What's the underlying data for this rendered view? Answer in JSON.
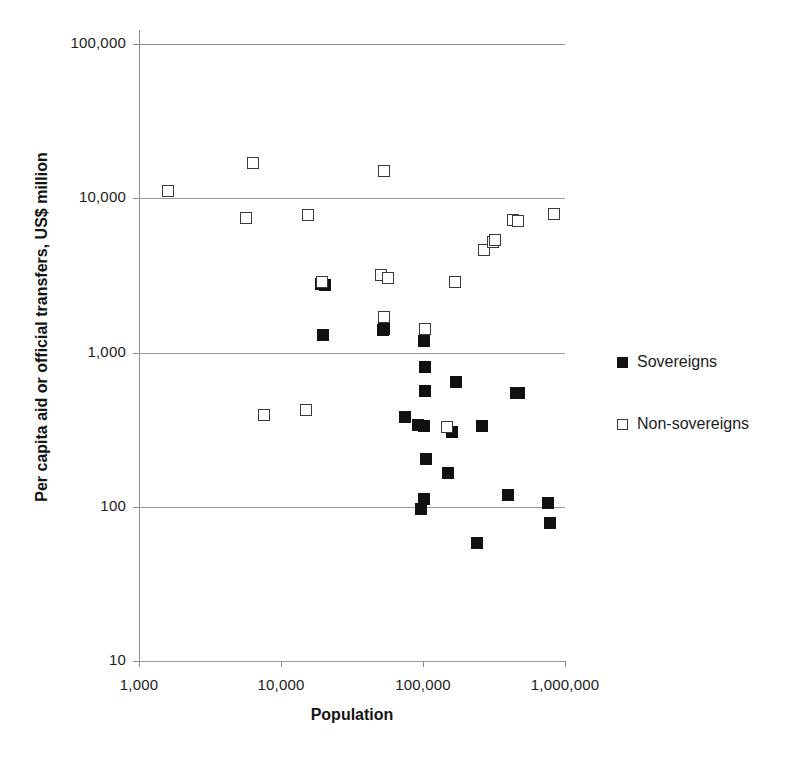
{
  "chart_data": {
    "type": "scatter",
    "title": "",
    "xlabel": "Population",
    "ylabel": "Per capita aid or official transfers, US$ million",
    "xscale": "log",
    "yscale": "log",
    "xlim": [
      1000,
      1000000
    ],
    "ylim": [
      10,
      100000
    ],
    "xticks": [
      1000,
      10000,
      100000,
      1000000
    ],
    "xtick_labels": [
      "1,000",
      "10,000",
      "100,000",
      "1,000,000"
    ],
    "yticks": [
      10,
      100,
      1000,
      10000,
      100000
    ],
    "ytick_labels": [
      "10",
      "100",
      "1,000",
      "10,000",
      "100,000"
    ],
    "grid": true,
    "grid_axis": "y",
    "legend_position": "right",
    "series": [
      {
        "name": "Sovereigns",
        "marker": "filled-square",
        "color": "#111111",
        "points": [
          {
            "x": 19200,
            "y": 2800
          },
          {
            "x": 20500,
            "y": 2750
          },
          {
            "x": 19800,
            "y": 1300
          },
          {
            "x": 52000,
            "y": 1400
          },
          {
            "x": 53000,
            "y": 1420
          },
          {
            "x": 101000,
            "y": 1180
          },
          {
            "x": 103000,
            "y": 800
          },
          {
            "x": 104000,
            "y": 560
          },
          {
            "x": 171000,
            "y": 640
          },
          {
            "x": 449000,
            "y": 545
          },
          {
            "x": 474000,
            "y": 550
          },
          {
            "x": 75000,
            "y": 380
          },
          {
            "x": 92000,
            "y": 340
          },
          {
            "x": 101000,
            "y": 335
          },
          {
            "x": 161000,
            "y": 305
          },
          {
            "x": 262000,
            "y": 335
          },
          {
            "x": 105000,
            "y": 205
          },
          {
            "x": 150000,
            "y": 165
          },
          {
            "x": 102000,
            "y": 112
          },
          {
            "x": 97000,
            "y": 96
          },
          {
            "x": 396000,
            "y": 119
          },
          {
            "x": 760000,
            "y": 105
          },
          {
            "x": 790000,
            "y": 79
          },
          {
            "x": 240000,
            "y": 58
          }
        ]
      },
      {
        "name": "Non-sovereigns",
        "marker": "open-square",
        "color": "#3a3a3a",
        "points": [
          {
            "x": 1600,
            "y": 11200
          },
          {
            "x": 6400,
            "y": 17000
          },
          {
            "x": 53000,
            "y": 15000
          },
          {
            "x": 5700,
            "y": 7500
          },
          {
            "x": 15500,
            "y": 7800
          },
          {
            "x": 430000,
            "y": 7200
          },
          {
            "x": 470000,
            "y": 7100
          },
          {
            "x": 840000,
            "y": 7900
          },
          {
            "x": 270000,
            "y": 4600
          },
          {
            "x": 310000,
            "y": 5200
          },
          {
            "x": 320000,
            "y": 5350
          },
          {
            "x": 51000,
            "y": 3200
          },
          {
            "x": 57000,
            "y": 3050
          },
          {
            "x": 19500,
            "y": 2850
          },
          {
            "x": 168000,
            "y": 2850
          },
          {
            "x": 53000,
            "y": 1700
          },
          {
            "x": 104000,
            "y": 1430
          },
          {
            "x": 7600,
            "y": 395
          },
          {
            "x": 15000,
            "y": 425
          },
          {
            "x": 148000,
            "y": 330
          }
        ]
      }
    ]
  },
  "axes": {
    "y_title": "Per capita aid or official transfers, US$ million",
    "x_title": "Population"
  },
  "legend": {
    "items": [
      {
        "label": "Sovereigns",
        "marker": "filled-square"
      },
      {
        "label": "Non-sovereigns",
        "marker": "open-square"
      }
    ]
  }
}
